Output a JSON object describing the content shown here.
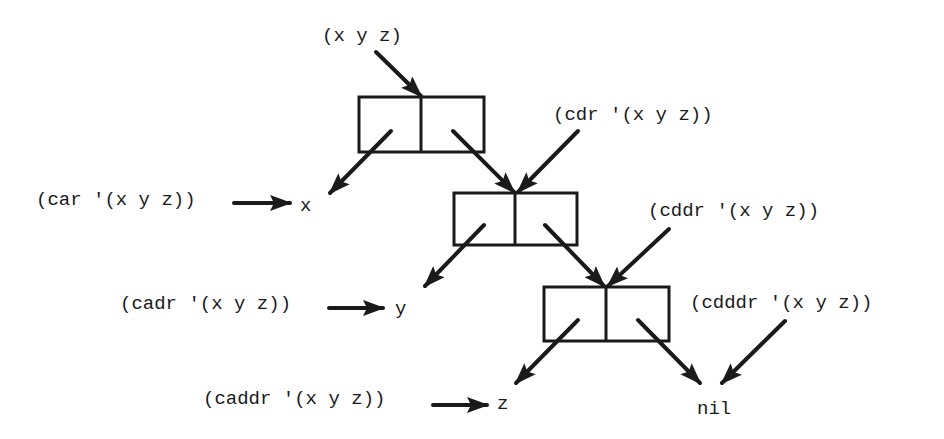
{
  "diagram": {
    "title": "",
    "colors": {
      "ink": "#1a1a1a",
      "background": "#ffffff"
    },
    "root_label": "(x y z)",
    "cells": [
      {
        "id": "cell-1",
        "x": 359,
        "y": 97,
        "w": 125,
        "h": 55
      },
      {
        "id": "cell-2",
        "x": 454,
        "y": 193,
        "w": 123,
        "h": 52
      },
      {
        "id": "cell-3",
        "x": 544,
        "y": 287,
        "w": 125,
        "h": 54
      }
    ],
    "labels": {
      "root": "(x y z)",
      "car": "(car '(x y z))",
      "x": "x",
      "cdr": "(cdr '(x y z))",
      "cadr": "(cadr '(x y z))",
      "y": "y",
      "cddr": "(cddr '(x y z))",
      "caddr": "(caddr '(x y z))",
      "z": "z",
      "cdddr": "(cdddr '(x y z))",
      "nil": "nil"
    }
  }
}
